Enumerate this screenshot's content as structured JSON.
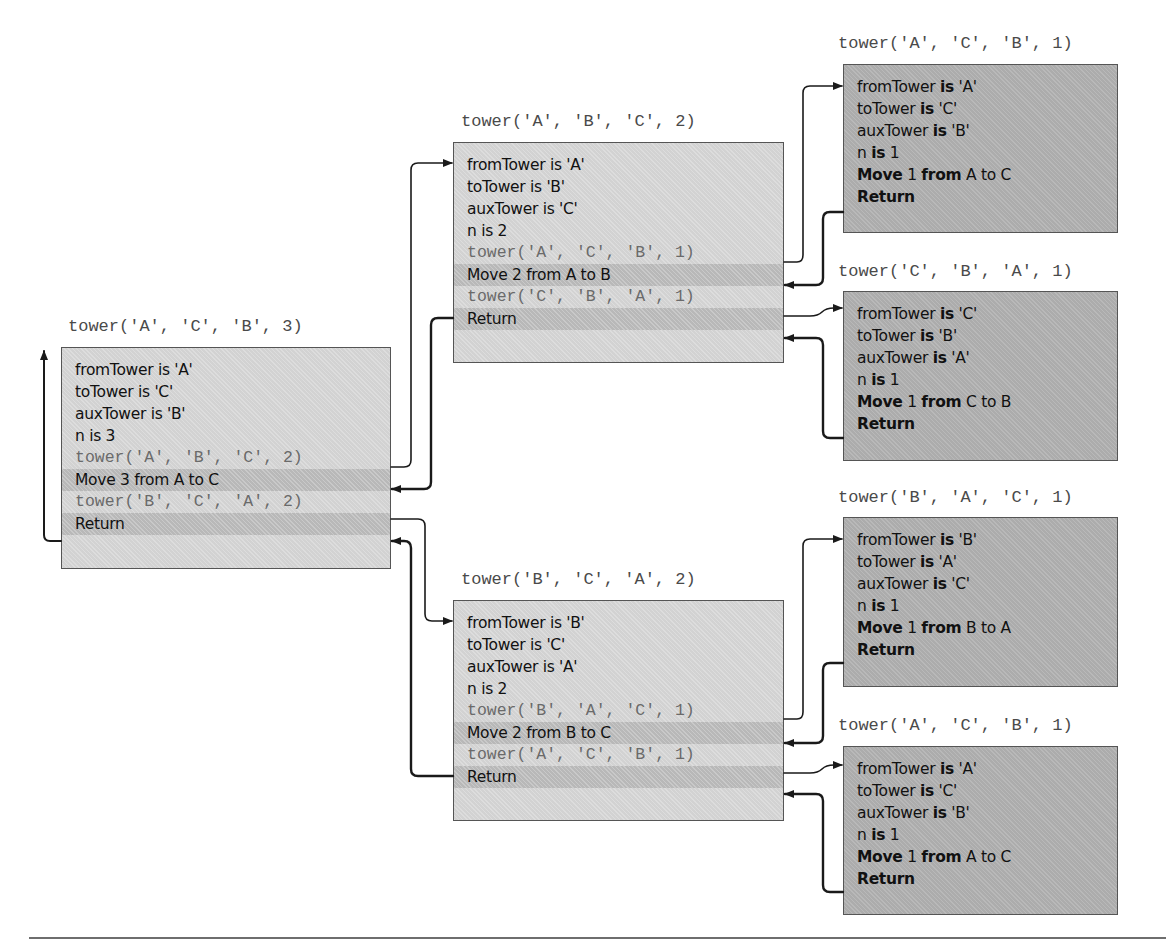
{
  "colors": {
    "arrow": "#1a1a1a",
    "mid_frame_fill": "#d9d9d9",
    "leaf_frame_fill": "#b3b3b3",
    "highlight_row_fill": "#c2c2c2",
    "call_text": "#6a6a6a",
    "border": "#555555"
  },
  "frames": {
    "root": {
      "call": "tower('A', 'C', 'B', 3)",
      "lines": {
        "from": "fromTower is 'A'",
        "to": "toTower is 'C'",
        "aux": "auxTower is 'B'",
        "n": "n is 3",
        "call1": "tower('A', 'B', 'C', 2)",
        "move": "Move 3 from A to C",
        "call2": "tower('B', 'C', 'A', 2)",
        "ret": "Return"
      }
    },
    "mid_top": {
      "call": "tower('A', 'B', 'C', 2)",
      "lines": {
        "from": "fromTower is 'A'",
        "to": "toTower is 'B'",
        "aux": "auxTower is 'C'",
        "n": "n is 2",
        "call1": "tower('A', 'C', 'B', 1)",
        "move": "Move 2 from A to B",
        "call2": "tower('C', 'B', 'A', 1)",
        "ret": "Return"
      }
    },
    "mid_bottom": {
      "call": "tower('B', 'C', 'A', 2)",
      "lines": {
        "from": "fromTower is 'B'",
        "to": "toTower is 'C'",
        "aux": "auxTower is 'A'",
        "n": "n is 2",
        "call1": "tower('B', 'A', 'C', 1)",
        "move": "Move 2 from B to C",
        "call2": "tower('A', 'C', 'B', 1)",
        "ret": "Return"
      }
    },
    "leaf1": {
      "call": "tower('A', 'C', 'B', 1)",
      "from_val": "'A'",
      "to_val": "'C'",
      "aux_val": "'B'",
      "n_val": "1",
      "move_n": "1",
      "move_src": "A",
      "move_dst": "C"
    },
    "leaf2": {
      "call": "tower('C', 'B', 'A', 1)",
      "from_val": "'C'",
      "to_val": "'B'",
      "aux_val": "'A'",
      "n_val": "1",
      "move_n": "1",
      "move_src": "C",
      "move_dst": "B"
    },
    "leaf3": {
      "call": "tower('B', 'A', 'C', 1)",
      "from_val": "'B'",
      "to_val": "'A'",
      "aux_val": "'C'",
      "n_val": "1",
      "move_n": "1",
      "move_src": "B",
      "move_dst": "A"
    },
    "leaf4": {
      "call": "tower('A', 'C', 'B', 1)",
      "from_val": "'A'",
      "to_val": "'C'",
      "aux_val": "'B'",
      "n_val": "1",
      "move_n": "1",
      "move_src": "A",
      "move_dst": "C"
    }
  },
  "leaf_words": {
    "from_kw": "fromTower",
    "to_kw": "toTower",
    "aux_kw": "auxTower",
    "n_kw": "n",
    "is": "is",
    "move": "Move",
    "from": "from",
    "to": "to",
    "ret": "Return"
  }
}
